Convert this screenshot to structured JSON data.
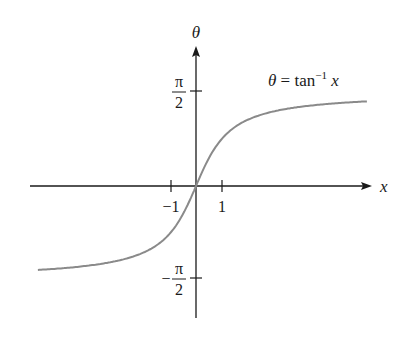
{
  "chart_data": {
    "type": "line",
    "title": "",
    "function_label": {
      "lhs": "θ",
      "eq": " = tan",
      "sup": "−1",
      "var": " x"
    },
    "xlabel": "x",
    "ylabel": "θ",
    "xticks": [
      {
        "value": -1,
        "label": "−1"
      },
      {
        "value": 1,
        "label": "1"
      }
    ],
    "yticks": [
      {
        "value": 1.5708,
        "label_num": "π",
        "label_den": "2",
        "sign": ""
      },
      {
        "value": -1.5708,
        "label_num": "π",
        "label_den": "2",
        "sign": "−"
      }
    ],
    "xlim": [
      -6.5,
      6.8
    ],
    "ylim": [
      -2.2,
      2.3
    ],
    "grid": false,
    "legend": "none",
    "series": [
      {
        "name": "θ = tan⁻¹ x",
        "color": "#8a8a8a",
        "x": [
          -6.2,
          -5,
          -4,
          -3,
          -2,
          -1.5,
          -1,
          -0.5,
          0,
          0.5,
          1,
          1.5,
          2,
          3,
          4,
          5,
          6.7
        ],
        "y": [
          -1.4109,
          -1.3734,
          -1.3258,
          -1.249,
          -1.1071,
          -0.9828,
          -0.7854,
          -0.4636,
          0,
          0.4636,
          0.7854,
          0.9828,
          1.1071,
          1.249,
          1.3258,
          1.3734,
          1.4229
        ]
      }
    ],
    "asymptotes": [
      1.5708,
      -1.5708
    ]
  },
  "colors": {
    "axis": "#1a1a1a",
    "curve": "#8a8a8a"
  }
}
